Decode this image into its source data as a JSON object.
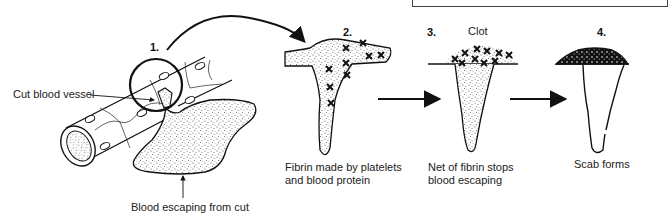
{
  "diagram": {
    "steps": [
      {
        "number": "1.",
        "caption": "",
        "labels": [
          "Cut blood vessel",
          "Blood escaping from cut"
        ]
      },
      {
        "number": "2.",
        "caption": "Fibrin made by platelets\nand blood protein"
      },
      {
        "number": "3.",
        "title": "Clot",
        "caption": "Net of fibrin stops\nblood escaping"
      },
      {
        "number": "4.",
        "caption": "Scab forms"
      }
    ],
    "labels": {
      "cut_vessel": "Cut blood vessel",
      "blood_escaping": "Blood escaping from cut",
      "step1": "1.",
      "step2": "2.",
      "step3": "3.",
      "step4": "4.",
      "clot": "Clot",
      "caption2_line1": "Fibrin made by platelets",
      "caption2_line2": "and blood protein",
      "caption3_line1": "Net of fibrin stops",
      "caption3_line2": "blood escaping",
      "caption4": "Scab forms"
    },
    "colors": {
      "ink": "#111111",
      "stipple": "#555555",
      "background": "#ffffff"
    }
  }
}
